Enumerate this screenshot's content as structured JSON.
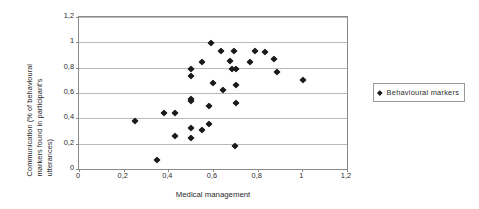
{
  "chart_data": {
    "type": "scatter",
    "title": "",
    "xlabel": "Medical management",
    "ylabel": "Communication (% of behavioural markers found in participant's utterances)",
    "ylabel_lines": [
      "Communication (% of behavioural",
      "markers found in participant's",
      "utterances)"
    ],
    "xlim": [
      0,
      1.2
    ],
    "ylim": [
      0,
      1.2
    ],
    "xticks": [
      0,
      0.2,
      0.4,
      0.6,
      0.8,
      1,
      1.2
    ],
    "yticks": [
      0,
      0.2,
      0.4,
      0.6,
      0.8,
      1,
      1.2
    ],
    "xticklabels": [
      "0",
      "0,2",
      "0,4",
      "0,6",
      "0,8",
      "1",
      "1,2"
    ],
    "yticklabels": [
      "0",
      "0,2",
      "0,4",
      "0,6",
      "0,8",
      "1",
      "1,2"
    ],
    "grid": "horizontal",
    "legend_position": "right",
    "marker": "diamond",
    "marker_color": "#1a1a1a",
    "series": [
      {
        "name": "Behavioural markers",
        "points": [
          [
            0.25,
            0.38
          ],
          [
            0.35,
            0.07
          ],
          [
            0.38,
            0.44
          ],
          [
            0.43,
            0.44
          ],
          [
            0.43,
            0.26
          ],
          [
            0.5,
            0.79
          ],
          [
            0.5,
            0.735
          ],
          [
            0.5,
            0.555
          ],
          [
            0.5,
            0.535
          ],
          [
            0.5,
            0.325
          ],
          [
            0.5,
            0.245
          ],
          [
            0.55,
            0.845
          ],
          [
            0.55,
            0.305
          ],
          [
            0.58,
            0.5
          ],
          [
            0.58,
            0.355
          ],
          [
            0.59,
            0.995
          ],
          [
            0.6,
            0.68
          ],
          [
            0.635,
            0.935
          ],
          [
            0.645,
            0.625
          ],
          [
            0.675,
            0.855
          ],
          [
            0.685,
            0.79
          ],
          [
            0.695,
            0.935
          ],
          [
            0.705,
            0.79
          ],
          [
            0.705,
            0.665
          ],
          [
            0.705,
            0.525
          ],
          [
            0.7,
            0.185
          ],
          [
            0.765,
            0.845
          ],
          [
            0.79,
            0.935
          ],
          [
            0.835,
            0.925
          ],
          [
            0.875,
            0.865
          ],
          [
            0.885,
            0.765
          ],
          [
            1.005,
            0.705
          ]
        ]
      }
    ]
  },
  "legend": {
    "entries": [
      {
        "label": "Behavioural markers",
        "marker": "diamond",
        "color": "#1a1a1a"
      }
    ]
  },
  "colors": {
    "marker": "#1a1a1a",
    "grid": "#b9b9b9",
    "frame": "#8a8a8a",
    "text": "#2b2b2b",
    "background": "#ffffff"
  }
}
